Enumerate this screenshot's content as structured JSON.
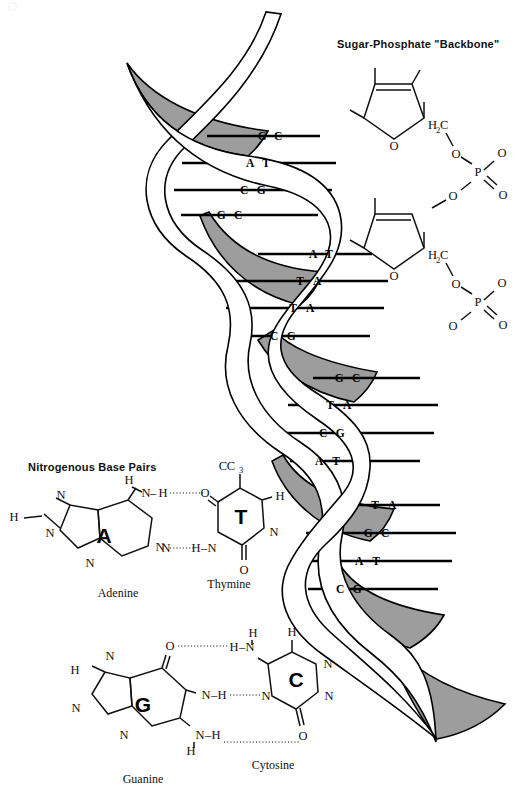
{
  "figure": {
    "background_color": "#ffffff",
    "ink_color": "#111111",
    "shaded_ribbon_color": "#9d9d9d"
  },
  "backbone_panel": {
    "title": "Sugar-Phosphate \"Backbone\"",
    "units": [
      {
        "sugar_ring_oxygen": "O",
        "exocyclic": "H",
        "methylene": "H",
        "methylene_sub": "2",
        "methylene_c": "C",
        "phosphate": {
          "p": "P",
          "o_top": "O",
          "o_right": "O",
          "o_double": "O",
          "o_bottom": "O"
        }
      },
      {
        "sugar_ring_oxygen": "O",
        "methylene": "H",
        "methylene_sub": "2",
        "methylene_c": "C",
        "phosphate": {
          "p": "P",
          "o_top": "O",
          "o_right": "O",
          "o_double": "O",
          "o_bottom": "O"
        }
      }
    ]
  },
  "base_pairs_panel": {
    "title": "Nitrogenous Base Pairs",
    "pairs": [
      {
        "left": {
          "letter": "A",
          "name": "Adenine",
          "atoms": [
            "H",
            "N",
            "N",
            "N",
            "H",
            "N",
            "N"
          ]
        },
        "right": {
          "letter": "T",
          "name": "Thymine",
          "atoms": [
            "C",
            "H",
            "3",
            "O",
            "H",
            "N",
            "O"
          ]
        },
        "hydrogen_bonds": 2,
        "bond_labels": [
          "N-H",
          "O",
          "N",
          "H-N"
        ]
      },
      {
        "left": {
          "letter": "G",
          "name": "Guanine",
          "atoms": [
            "N",
            "H",
            "N",
            "N",
            "O",
            "N-H",
            "N-H",
            "H"
          ]
        },
        "right": {
          "letter": "C",
          "name": "Cytosine",
          "atoms": [
            "H",
            "H",
            "N",
            "N",
            "N",
            "O"
          ]
        },
        "hydrogen_bonds": 3,
        "bond_labels": [
          "O",
          "H-N",
          "N-H",
          "N",
          "N-H",
          "O"
        ]
      }
    ]
  },
  "helix": {
    "turns": 4,
    "rung_groups": [
      {
        "group": 1,
        "rungs": [
          {
            "left": "G",
            "right": "C",
            "y": 136
          },
          {
            "left": "A",
            "right": "T",
            "y": 163
          },
          {
            "left": "C",
            "right": "G",
            "y": 190
          },
          {
            "left": "G",
            "right": "C",
            "y": 215
          }
        ]
      },
      {
        "group": 2,
        "rungs": [
          {
            "left": "A",
            "right": "T",
            "y": 254
          },
          {
            "left": "T",
            "right": "A",
            "y": 281
          },
          {
            "left": "T",
            "right": "A",
            "y": 308
          },
          {
            "left": "C",
            "right": "G",
            "y": 336
          }
        ]
      },
      {
        "group": 3,
        "rungs": [
          {
            "left": "G",
            "right": "C",
            "y": 378
          },
          {
            "left": "T",
            "right": "A",
            "y": 405
          },
          {
            "left": "C",
            "right": "G",
            "y": 433
          },
          {
            "left": "A",
            "right": "T",
            "y": 461
          }
        ]
      },
      {
        "group": 4,
        "rungs": [
          {
            "left": "T",
            "right": "A",
            "y": 505
          },
          {
            "left": "G",
            "right": "C",
            "y": 533
          },
          {
            "left": "A",
            "right": "T",
            "y": 561
          },
          {
            "left": "C",
            "right": "G",
            "y": 589
          }
        ]
      }
    ]
  }
}
